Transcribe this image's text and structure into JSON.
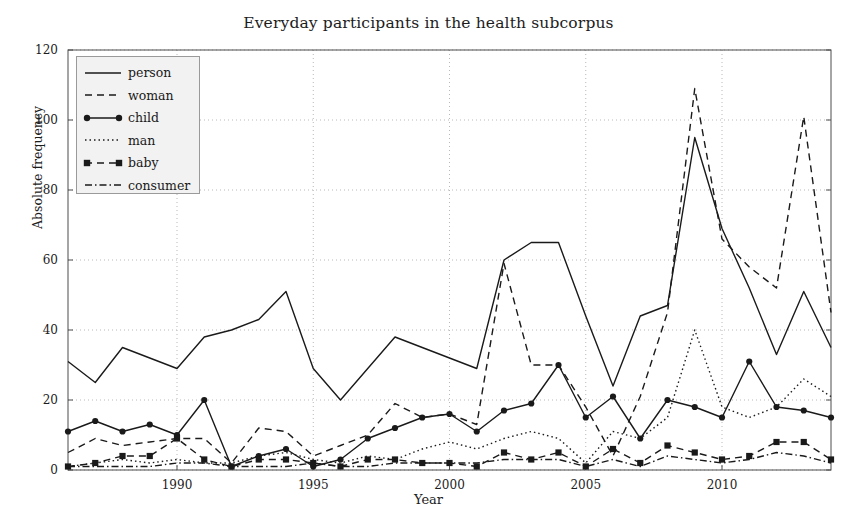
{
  "chart_data": {
    "type": "line",
    "title": "Everyday participants in the health subcorpus",
    "xlabel": "Year",
    "ylabel": "Absolute frequency",
    "xlim": [
      1986,
      2014
    ],
    "ylim": [
      0,
      120
    ],
    "xticks": [
      1990,
      1995,
      2000,
      2005,
      2010
    ],
    "yticks": [
      0,
      20,
      40,
      60,
      80,
      100,
      120
    ],
    "grid": true,
    "legend_position": "upper left",
    "x": [
      1986,
      1987,
      1988,
      1989,
      1990,
      1991,
      1992,
      1993,
      1994,
      1995,
      1996,
      1997,
      1998,
      1999,
      2000,
      2001,
      2002,
      2003,
      2004,
      2005,
      2006,
      2007,
      2008,
      2009,
      2010,
      2011,
      2012,
      2013,
      2014
    ],
    "series": [
      {
        "name": "person",
        "style": "solid",
        "marker": "none",
        "values": [
          31,
          25,
          35,
          32,
          29,
          38,
          40,
          43,
          51,
          29,
          20,
          29,
          38,
          35,
          32,
          29,
          60,
          65,
          65,
          44,
          24,
          44,
          47,
          95,
          69,
          52,
          33,
          51,
          35
        ]
      },
      {
        "name": "woman",
        "style": "dashed",
        "marker": "none",
        "values": [
          5,
          9,
          7,
          8,
          9,
          9,
          2,
          12,
          11,
          4,
          7,
          10,
          19,
          15,
          16,
          13,
          59,
          30,
          30,
          18,
          4,
          21,
          45,
          109,
          66,
          58,
          52,
          101,
          45
        ]
      },
      {
        "name": "child",
        "style": "solid",
        "marker": "circle",
        "values": [
          11,
          14,
          11,
          13,
          10,
          20,
          1,
          4,
          6,
          1,
          3,
          9,
          12,
          15,
          16,
          11,
          17,
          19,
          30,
          15,
          21,
          9,
          20,
          18,
          15,
          31,
          18,
          17,
          15
        ]
      },
      {
        "name": "man",
        "style": "dotted",
        "marker": "none",
        "values": [
          1,
          2,
          3,
          2,
          3,
          2,
          2,
          4,
          5,
          3,
          2,
          4,
          3,
          6,
          8,
          6,
          9,
          11,
          9,
          2,
          11,
          9,
          15,
          40,
          18,
          15,
          18,
          26,
          21
        ]
      },
      {
        "name": "baby",
        "style": "dashed",
        "marker": "square",
        "values": [
          1,
          2,
          4,
          4,
          9,
          3,
          1,
          3,
          3,
          2,
          1,
          3,
          3,
          2,
          2,
          1,
          5,
          3,
          5,
          1,
          6,
          2,
          7,
          5,
          3,
          4,
          8,
          8,
          3
        ]
      },
      {
        "name": "consumer",
        "style": "dashdot",
        "marker": "none",
        "values": [
          1,
          1,
          1,
          1,
          2,
          2,
          1,
          1,
          1,
          2,
          1,
          1,
          2,
          2,
          2,
          2,
          3,
          3,
          3,
          1,
          3,
          1,
          4,
          3,
          2,
          3,
          5,
          4,
          2
        ]
      }
    ]
  },
  "legend": {
    "items": [
      {
        "label": "person"
      },
      {
        "label": "woman"
      },
      {
        "label": "child"
      },
      {
        "label": "man"
      },
      {
        "label": "baby"
      },
      {
        "label": "consumer"
      }
    ]
  },
  "colors": {
    "line": "#1a1a1a",
    "grid": "#b9b9b9",
    "axis": "#4d4d4d",
    "legend_bg": "#f2f2f2",
    "background": "#ffffff"
  }
}
